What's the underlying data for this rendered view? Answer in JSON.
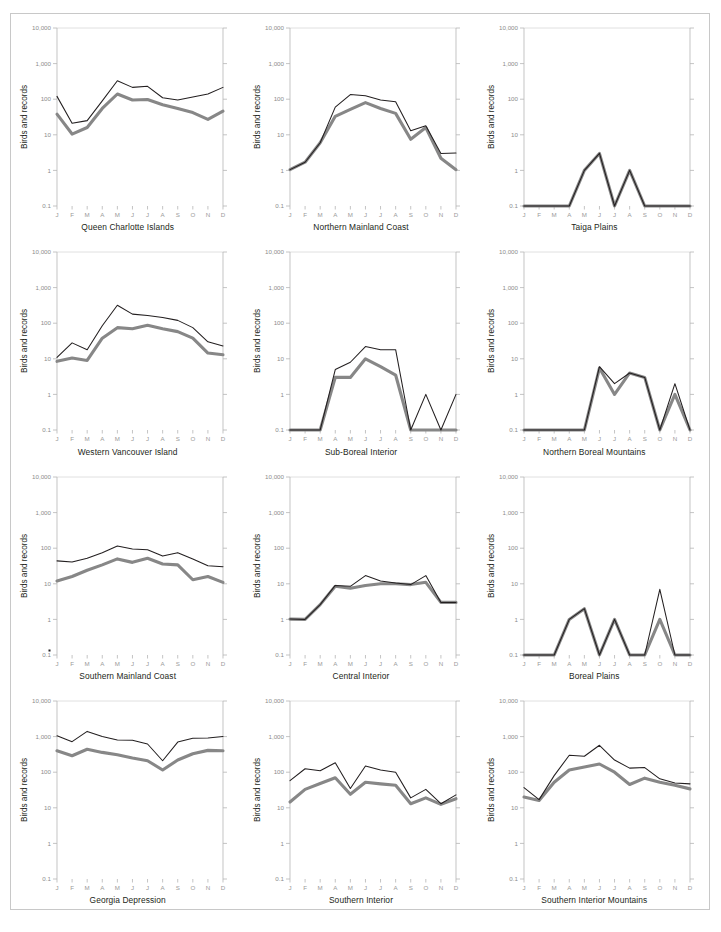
{
  "figure": {
    "y_axis_label": "Birds and records",
    "y_ticks": [
      "10,000",
      "1,000",
      "100",
      "10",
      "1",
      "0.1"
    ],
    "month_labels": [
      "J",
      "F",
      "M",
      "A",
      "M",
      "J",
      "J",
      "A",
      "S",
      "O",
      "N",
      "D"
    ],
    "colors": {
      "series_black": "#231f20",
      "series_gray": "#878787",
      "axis": "#b5b5b5",
      "grid": "#d8d8d8",
      "frame": "#c8c8c8",
      "tick_text": "#8c8c8c"
    }
  },
  "chart_data": [
    {
      "type": "line",
      "title": "Queen Charlotte Islands",
      "xlabel": "",
      "ylabel": "Birds and records",
      "ylim": [
        0.1,
        10000
      ],
      "yscale": "log",
      "grid": false,
      "categories": [
        "J",
        "F",
        "M",
        "A",
        "M",
        "J",
        "J",
        "A",
        "S",
        "O",
        "N",
        "D"
      ],
      "series": [
        {
          "name": "records",
          "color": "#231f20",
          "values": [
            120,
            21,
            25,
            90,
            330,
            215,
            230,
            110,
            95,
            115,
            140,
            215
          ]
        },
        {
          "name": "birds",
          "color": "#878787",
          "values": [
            38,
            10.5,
            16,
            55,
            140,
            95,
            98,
            70,
            55,
            42,
            27,
            46
          ]
        }
      ]
    },
    {
      "type": "line",
      "title": "Northern Mainland Coast",
      "ylim": [
        0.1,
        10000
      ],
      "yscale": "log",
      "categories": [
        "J",
        "F",
        "M",
        "A",
        "M",
        "J",
        "J",
        "A",
        "S",
        "O",
        "N",
        "D"
      ],
      "series": [
        {
          "name": "records",
          "color": "#231f20",
          "values": [
            1.05,
            1.7,
            6,
            60,
            135,
            125,
            95,
            85,
            13,
            18,
            3,
            3.1
          ]
        },
        {
          "name": "birds",
          "color": "#878787",
          "values": [
            1.05,
            1.7,
            6,
            33,
            52,
            80,
            55,
            40,
            7.5,
            16,
            2.2,
            1.05
          ]
        }
      ]
    },
    {
      "type": "line",
      "title": "Taiga Plains",
      "ylim": [
        0.1,
        10000
      ],
      "yscale": "log",
      "categories": [
        "J",
        "F",
        "M",
        "A",
        "M",
        "J",
        "J",
        "A",
        "S",
        "O",
        "N",
        "D"
      ],
      "series": [
        {
          "name": "records",
          "color": "#231f20",
          "values": [
            0.1,
            0.1,
            0.1,
            0.1,
            1,
            3,
            0.1,
            1,
            0.1,
            0.1,
            0.1,
            0.1
          ]
        },
        {
          "name": "birds",
          "color": "#878787",
          "values": [
            0.1,
            0.1,
            0.1,
            0.1,
            1,
            3,
            0.1,
            1,
            0.1,
            0.1,
            0.1,
            0.1
          ]
        }
      ]
    },
    {
      "type": "line",
      "title": "Western Vancouver Island",
      "ylim": [
        0.1,
        10000
      ],
      "yscale": "log",
      "categories": [
        "J",
        "F",
        "M",
        "A",
        "M",
        "J",
        "J",
        "A",
        "S",
        "O",
        "N",
        "D"
      ],
      "series": [
        {
          "name": "records",
          "color": "#231f20",
          "values": [
            11,
            28,
            18,
            85,
            320,
            180,
            165,
            145,
            120,
            75,
            30,
            23
          ]
        },
        {
          "name": "birds",
          "color": "#878787",
          "values": [
            8.5,
            10.5,
            9,
            38,
            75,
            70,
            88,
            70,
            58,
            38,
            14.5,
            13
          ]
        }
      ]
    },
    {
      "type": "line",
      "title": "Sub-Boreal Interior",
      "ylim": [
        0.1,
        10000
      ],
      "yscale": "log",
      "categories": [
        "J",
        "F",
        "M",
        "A",
        "M",
        "J",
        "J",
        "A",
        "S",
        "O",
        "N",
        "D"
      ],
      "series": [
        {
          "name": "records",
          "color": "#231f20",
          "values": [
            0.1,
            0.1,
            0.1,
            5,
            8,
            22,
            18,
            18,
            0.1,
            1,
            0.1,
            1
          ]
        },
        {
          "name": "birds",
          "color": "#878787",
          "values": [
            0.1,
            0.1,
            0.1,
            3,
            3,
            10,
            6,
            3.5,
            0.1,
            0.1,
            0.1,
            0.1
          ]
        }
      ]
    },
    {
      "type": "line",
      "title": "Northern Boreal Mountains",
      "ylim": [
        0.1,
        10000
      ],
      "yscale": "log",
      "categories": [
        "J",
        "F",
        "M",
        "A",
        "M",
        "J",
        "J",
        "A",
        "S",
        "O",
        "N",
        "D"
      ],
      "series": [
        {
          "name": "records",
          "color": "#231f20",
          "values": [
            0.1,
            0.1,
            0.1,
            0.1,
            0.1,
            6,
            2,
            4,
            3,
            0.1,
            2,
            0.1
          ]
        },
        {
          "name": "birds",
          "color": "#878787",
          "values": [
            0.1,
            0.1,
            0.1,
            0.1,
            0.1,
            5.5,
            1,
            4,
            3,
            0.1,
            1,
            0.1
          ]
        }
      ]
    },
    {
      "type": "line",
      "title": "Southern Mainland Coast",
      "ylim": [
        0.1,
        10000
      ],
      "yscale": "log",
      "categories": [
        "J",
        "F",
        "M",
        "A",
        "M",
        "J",
        "J",
        "A",
        "S",
        "O",
        "N",
        "D"
      ],
      "series": [
        {
          "name": "records",
          "color": "#231f20",
          "values": [
            44,
            41,
            52,
            75,
            115,
            95,
            90,
            60,
            75,
            50,
            32,
            30
          ]
        },
        {
          "name": "birds",
          "color": "#878787",
          "values": [
            12,
            16,
            24,
            34,
            50,
            40,
            52,
            36,
            34,
            13,
            16,
            11
          ]
        }
      ]
    },
    {
      "type": "line",
      "title": "Central Interior",
      "ylim": [
        0.1,
        10000
      ],
      "yscale": "log",
      "categories": [
        "J",
        "F",
        "M",
        "A",
        "M",
        "J",
        "J",
        "A",
        "S",
        "O",
        "N",
        "D"
      ],
      "series": [
        {
          "name": "records",
          "color": "#231f20",
          "values": [
            1.02,
            1.0,
            2.6,
            9,
            8.5,
            17,
            12,
            10.5,
            9.5,
            17,
            3,
            3
          ]
        },
        {
          "name": "birds",
          "color": "#878787",
          "values": [
            1.02,
            1.0,
            2.6,
            8.5,
            7.5,
            9,
            10,
            10,
            9.5,
            11,
            3,
            3
          ]
        }
      ]
    },
    {
      "type": "line",
      "title": "Boreal Plains",
      "ylim": [
        0.1,
        10000
      ],
      "yscale": "log",
      "categories": [
        "J",
        "F",
        "M",
        "A",
        "M",
        "J",
        "J",
        "A",
        "S",
        "O",
        "N",
        "D"
      ],
      "series": [
        {
          "name": "records",
          "color": "#231f20",
          "values": [
            0.1,
            0.1,
            0.1,
            1,
            2,
            0.1,
            1,
            0.1,
            0.1,
            7,
            0.1,
            0.1
          ]
        },
        {
          "name": "birds",
          "color": "#878787",
          "values": [
            0.1,
            0.1,
            0.1,
            1,
            2,
            0.1,
            1,
            0.1,
            0.1,
            1,
            0.1,
            0.1
          ]
        }
      ]
    },
    {
      "type": "line",
      "title": "Georgia Depression",
      "ylim": [
        0.1,
        10000
      ],
      "yscale": "log",
      "categories": [
        "J",
        "F",
        "M",
        "A",
        "M",
        "J",
        "J",
        "A",
        "S",
        "O",
        "N",
        "D"
      ],
      "series": [
        {
          "name": "records",
          "color": "#231f20",
          "values": [
            1050,
            720,
            1400,
            1000,
            800,
            790,
            620,
            210,
            700,
            900,
            910,
            1000
          ]
        },
        {
          "name": "birds",
          "color": "#878787",
          "values": [
            400,
            290,
            440,
            360,
            310,
            250,
            210,
            115,
            220,
            330,
            410,
            400
          ]
        }
      ]
    },
    {
      "type": "line",
      "title": "Southern Interior",
      "ylim": [
        0.1,
        10000
      ],
      "yscale": "log",
      "categories": [
        "J",
        "F",
        "M",
        "A",
        "M",
        "J",
        "J",
        "A",
        "S",
        "O",
        "N",
        "D"
      ],
      "series": [
        {
          "name": "records",
          "color": "#231f20",
          "values": [
            58,
            125,
            110,
            185,
            35,
            150,
            115,
            100,
            19,
            33,
            13,
            23
          ]
        },
        {
          "name": "birds",
          "color": "#878787",
          "values": [
            14.5,
            33,
            48,
            70,
            24,
            52,
            47,
            43,
            13,
            19,
            12.5,
            18
          ]
        }
      ]
    },
    {
      "type": "line",
      "title": "Southern Interior Mountains",
      "ylim": [
        0.1,
        10000
      ],
      "yscale": "log",
      "categories": [
        "J",
        "F",
        "M",
        "A",
        "M",
        "J",
        "J",
        "A",
        "S",
        "O",
        "N",
        "D"
      ],
      "series": [
        {
          "name": "records",
          "color": "#231f20",
          "values": [
            37,
            17,
            80,
            300,
            280,
            570,
            220,
            130,
            135,
            65,
            50,
            47
          ]
        },
        {
          "name": "birds",
          "color": "#878787",
          "values": [
            20,
            16,
            52,
            115,
            140,
            170,
            100,
            45,
            68,
            52,
            43,
            34
          ]
        }
      ]
    }
  ]
}
